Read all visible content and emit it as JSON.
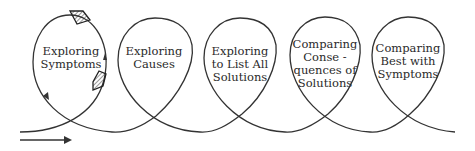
{
  "diagram": {
    "title": "",
    "stroke_color": "#333333",
    "stages": [
      {
        "lines": [
          "Exploring",
          "Symptoms"
        ]
      },
      {
        "lines": [
          "Exploring",
          "Causes"
        ]
      },
      {
        "lines": [
          "Exploring",
          "to List All",
          "Solutions"
        ]
      },
      {
        "lines": [
          "Comparing",
          "Conse -",
          "quences of",
          "Solutions"
        ]
      },
      {
        "lines": [
          "Comparing",
          "Best with",
          "Symptoms"
        ]
      }
    ],
    "icons": {
      "entry_arrow": "right-arrow-icon",
      "loop_direction_arrows": "triangle-arrow-icon",
      "markers": "hatched-diamond-icon"
    }
  }
}
